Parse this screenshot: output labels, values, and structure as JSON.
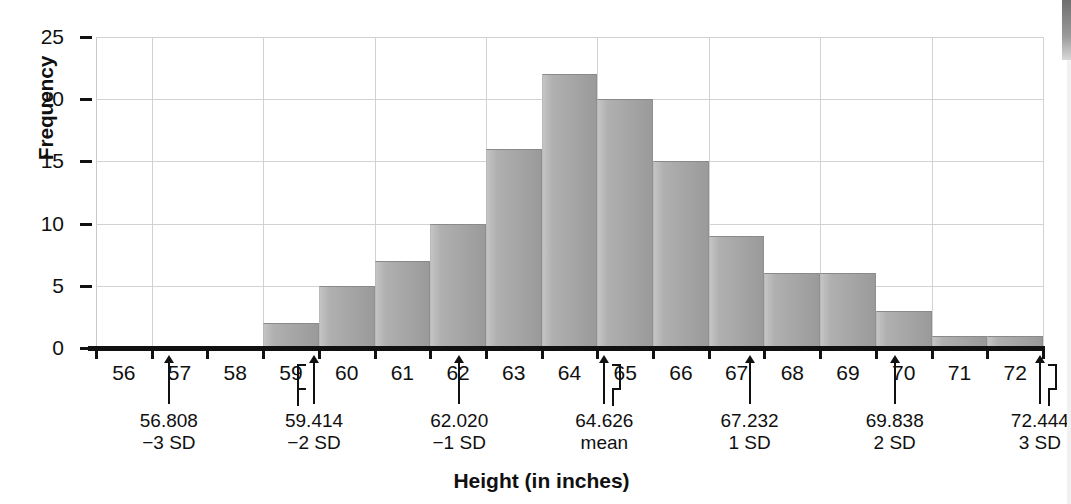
{
  "chart_data": {
    "type": "bar",
    "title": "",
    "xlabel": "Height (in inches)",
    "ylabel": "Frequency",
    "ylim": [
      0,
      25
    ],
    "yticks": [
      0,
      5,
      10,
      15,
      20,
      25
    ],
    "grid": true,
    "legend": null,
    "categories": [
      "56",
      "57",
      "58",
      "59",
      "60",
      "61",
      "62",
      "63",
      "64",
      "65",
      "66",
      "67",
      "68",
      "69",
      "70",
      "71",
      "72"
    ],
    "values": [
      0,
      0,
      0,
      2,
      5,
      7,
      10,
      16,
      22,
      20,
      15,
      9,
      6,
      6,
      3,
      1,
      1
    ],
    "bin_edges": [
      55.5,
      56.5,
      57.5,
      58.5,
      59.5,
      60.5,
      61.5,
      62.5,
      63.5,
      64.5,
      65.5,
      66.5,
      67.5,
      68.5,
      69.5,
      70.5,
      71.5,
      72.5
    ],
    "annotations": [
      {
        "value": "56.808",
        "label": "−3 SD",
        "x": 56.808,
        "bracket": "none"
      },
      {
        "value": "59.414",
        "label": "−2 SD",
        "x": 59.414,
        "bracket": "left"
      },
      {
        "value": "62.020",
        "label": "−1 SD",
        "x": 62.02,
        "bracket": "none"
      },
      {
        "value": "64.626",
        "label": "mean",
        "x": 64.626,
        "bracket": "right"
      },
      {
        "value": "67.232",
        "label": "1 SD",
        "x": 67.232,
        "bracket": "none"
      },
      {
        "value": "69.838",
        "label": "2 SD",
        "x": 69.838,
        "bracket": "none"
      },
      {
        "value": "72.444",
        "label": "3 SD",
        "x": 72.444,
        "bracket": "right"
      }
    ],
    "colors": {
      "bar_fill": "#a8a8a8",
      "bar_edge": "#8a8a8a",
      "grid": "#d2d2d2",
      "axis": "#111111",
      "background": "#ffffff"
    }
  }
}
